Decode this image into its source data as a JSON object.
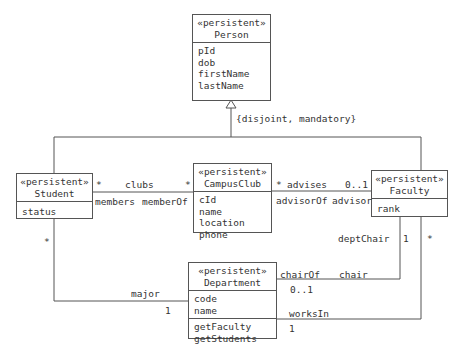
{
  "classes": {
    "person": {
      "stereotype": "«persistent»",
      "name": "Person",
      "attributes": [
        "pId",
        "dob",
        "firstName",
        "lastName"
      ]
    },
    "student": {
      "stereotype": "«persistent»",
      "name": "Student",
      "attributes": [
        "status"
      ]
    },
    "campusclub": {
      "stereotype": "«persistent»",
      "name": "CampusClub",
      "attributes": [
        "cId",
        "name",
        "location",
        "phone"
      ]
    },
    "faculty": {
      "stereotype": "«persistent»",
      "name": "Faculty",
      "attributes": [
        "rank"
      ]
    },
    "department": {
      "stereotype": "«persistent»",
      "name": "Department",
      "attributes": [
        "code",
        "name"
      ],
      "operations": [
        "getFaculty",
        "getStudents"
      ]
    }
  },
  "generalization": {
    "constraint": "{disjoint, mandatory}"
  },
  "associations": {
    "clubs": {
      "name": "clubs",
      "mult_student": "*",
      "mult_club": "*",
      "role_student": "members",
      "role_club": "memberOf"
    },
    "advises": {
      "name": "advises",
      "mult_club": "*",
      "mult_faculty": "0..1",
      "role_club": "advisorOf",
      "role_faculty": "advisor"
    },
    "major": {
      "name": "major",
      "mult_student": "*",
      "mult_department": "1"
    },
    "chair": {
      "role_department": "chairOf",
      "role_faculty": "chair",
      "mult_department": "0..1",
      "mult_faculty": "1",
      "faculty_end_label": "deptChair"
    },
    "worksin": {
      "role_department": "worksIn",
      "mult_department": "1",
      "mult_faculty": "*"
    }
  }
}
